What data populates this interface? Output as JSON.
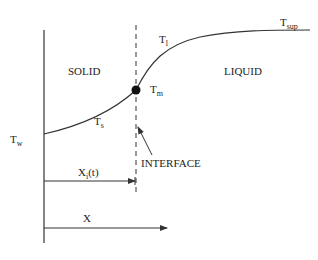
{
  "diagram": {
    "regions": {
      "solid": "SOLID",
      "liquid": "LIQUID"
    },
    "temperatures": {
      "wall": {
        "main": "T",
        "sub": "w"
      },
      "solid": {
        "main": "T",
        "sub": "s"
      },
      "liquid": {
        "main": "T",
        "sub": "l"
      },
      "melting": {
        "main": "T",
        "sub": "m"
      },
      "superheat": {
        "main": "T",
        "sub": "sup"
      }
    },
    "interface_label": "INTERFACE",
    "interface_position": {
      "main": "X",
      "sub": "i",
      "suffix": "(t)"
    },
    "axis_label": "X",
    "colors": {
      "line": "#333333",
      "dot": "#111111"
    }
  }
}
